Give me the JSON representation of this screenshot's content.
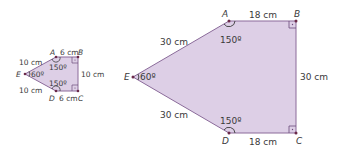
{
  "colors": {
    "fill": "#ddcfe6",
    "stroke": "#8b6b9a",
    "point": "#6b2a4a",
    "text": "#3a3a3a"
  },
  "small_figure": {
    "vertices": {
      "A": "A",
      "B": "B",
      "C": "C",
      "D": "D",
      "E": "E"
    },
    "sides": {
      "EA": "10 cm",
      "AB": "6 cm",
      "BC": "10 cm",
      "DC": "6 cm",
      "ED": "10 cm"
    },
    "angles": {
      "A": "150º",
      "D": "150º",
      "E": "60º"
    }
  },
  "large_figure": {
    "vertices": {
      "A": "A",
      "B": "B",
      "C": "C",
      "D": "D",
      "E": "E"
    },
    "sides": {
      "EA": "30 cm",
      "AB": "18 cm",
      "BC": "30 cm",
      "DC": "18 cm",
      "ED": "30 cm"
    },
    "angles": {
      "A": "150º",
      "D": "150º",
      "E": "60º"
    }
  }
}
